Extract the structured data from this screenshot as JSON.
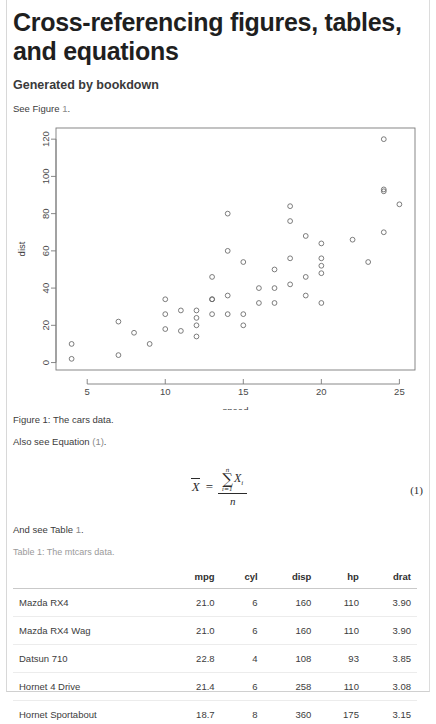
{
  "document": {
    "title": "Cross-referencing figures, tables, and equations",
    "subtitle": "Generated by bookdown",
    "figure_ref_text_before": "See Figure ",
    "figure_ref_link": "1",
    "figure_ref_text_after": ".",
    "equation_ref_text_before": "Also see Equation ",
    "equation_ref_link": "(1)",
    "equation_ref_text_after": ".",
    "table_ref_text_before": "And see Table ",
    "table_ref_link": "1",
    "table_ref_text_after": ".",
    "figure_caption": "Figure 1: The cars data.",
    "table_caption": "Table 1: The mtcars data.",
    "equation_number": "(1)"
  },
  "equation": {
    "lhs": "X",
    "relation": "=",
    "sum_glyph": "∑",
    "sum_lower": "i=1",
    "sum_upper": "n",
    "numerator_term": "X",
    "numerator_subscript": "i",
    "denominator": "n"
  },
  "chart_data": {
    "type": "scatter",
    "title": "",
    "xlabel": "speed",
    "ylabel": "dist",
    "xlim": [
      3.0,
      26.0
    ],
    "ylim": [
      -4,
      126
    ],
    "xticks": [
      5,
      10,
      15,
      20,
      25
    ],
    "yticks": [
      0,
      20,
      40,
      60,
      80,
      100,
      120
    ],
    "grid": false,
    "legend": "none",
    "marker": "open-circle",
    "marker_color": "#666666",
    "x": [
      4,
      4,
      7,
      7,
      8,
      9,
      10,
      10,
      10,
      11,
      11,
      12,
      12,
      12,
      12,
      13,
      13,
      13,
      13,
      14,
      14,
      14,
      14,
      15,
      15,
      15,
      16,
      16,
      17,
      17,
      17,
      18,
      18,
      18,
      18,
      19,
      19,
      19,
      20,
      20,
      20,
      20,
      20,
      22,
      23,
      24,
      24,
      24,
      24,
      25
    ],
    "y": [
      2,
      10,
      4,
      22,
      16,
      10,
      18,
      26,
      34,
      17,
      28,
      14,
      20,
      24,
      28,
      26,
      34,
      34,
      46,
      26,
      36,
      60,
      80,
      20,
      26,
      54,
      32,
      40,
      32,
      40,
      50,
      42,
      56,
      76,
      84,
      36,
      46,
      68,
      32,
      48,
      52,
      56,
      64,
      66,
      54,
      70,
      92,
      93,
      120,
      85
    ]
  },
  "table": {
    "columns": [
      "",
      "mpg",
      "cyl",
      "disp",
      "hp",
      "drat"
    ],
    "rows": [
      {
        "name": "Mazda RX4",
        "mpg": "21.0",
        "cyl": "6",
        "disp": "160",
        "hp": "110",
        "drat": "3.90"
      },
      {
        "name": "Mazda RX4 Wag",
        "mpg": "21.0",
        "cyl": "6",
        "disp": "160",
        "hp": "110",
        "drat": "3.90"
      },
      {
        "name": "Datsun 710",
        "mpg": "22.8",
        "cyl": "4",
        "disp": "108",
        "hp": "93",
        "drat": "3.85"
      },
      {
        "name": "Hornet 4 Drive",
        "mpg": "21.4",
        "cyl": "6",
        "disp": "258",
        "hp": "110",
        "drat": "3.08"
      },
      {
        "name": "Hornet Sportabout",
        "mpg": "18.7",
        "cyl": "8",
        "disp": "360",
        "hp": "175",
        "drat": "3.15"
      }
    ]
  }
}
